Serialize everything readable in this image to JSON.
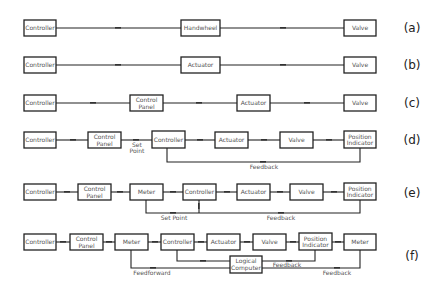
{
  "rows": [
    {
      "label": "(a)",
      "boxes": [
        "Controller",
        "Handwheel",
        "Valve"
      ]
    },
    {
      "label": "(b)",
      "boxes": [
        "Controller",
        "Actuator",
        "Valve"
      ]
    },
    {
      "label": "(c)",
      "boxes": [
        "Controller",
        "Control Panel",
        "Actuator",
        "Valve"
      ]
    },
    {
      "label": "(d)",
      "boxes": [
        "Controller",
        "Control Panel",
        "Controller",
        "Actuator",
        "Valve",
        "Position Indicator"
      ],
      "annotations": {
        "set_point_1": "Set",
        "set_point_2": "Point",
        "feedback": "Feedback"
      }
    },
    {
      "label": "(e)",
      "boxes": [
        "Controller",
        "Control Panel",
        "Meter",
        "Controller",
        "Actuator",
        "Valve",
        "Position Indicator"
      ],
      "annotations": {
        "set_point": "Set  Point",
        "feedback": "Feedback"
      }
    },
    {
      "label": "(f)",
      "boxes": [
        "Controller",
        "Control Panel",
        "Meter",
        "Controller",
        "Actuator",
        "Valve",
        "Position Indicator",
        "Meter"
      ],
      "extra_box_1": "Logical",
      "extra_box_2": "Computer",
      "annotations": {
        "feedforward": "Feedforward",
        "feedback_1": "Feedback",
        "feedback_2": "Feedback"
      }
    }
  ],
  "split": {
    "control_panel_1": "Control",
    "control_panel_2": "Panel",
    "position_indicator_1": "Position",
    "position_indicator_2": "Indicator"
  }
}
